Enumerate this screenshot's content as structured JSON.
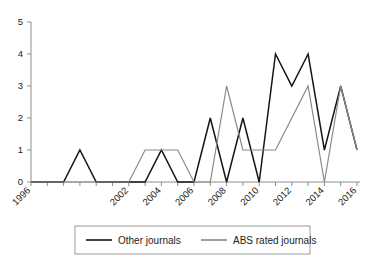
{
  "chart_data": {
    "type": "line",
    "title": "",
    "xlabel": "",
    "ylabel": "",
    "x": [
      1996,
      1997,
      1998,
      1999,
      2000,
      2001,
      2002,
      2003,
      2004,
      2005,
      2006,
      2007,
      2008,
      2009,
      2010,
      2011,
      2012,
      2013,
      2014,
      2015,
      2016
    ],
    "xtick_labels": [
      "1996",
      "2002",
      "2004",
      "2006",
      "2008",
      "2010",
      "2012",
      "2014",
      "2016"
    ],
    "xtick_values": [
      1996,
      2002,
      2004,
      2006,
      2008,
      2010,
      2012,
      2014,
      2016
    ],
    "ytick_labels": [
      "0",
      "1",
      "2",
      "3",
      "4",
      "5"
    ],
    "ytick_values": [
      0,
      1,
      2,
      3,
      4,
      5
    ],
    "xlim": [
      1996,
      2016
    ],
    "ylim": [
      0,
      5
    ],
    "grid": false,
    "legend_position": "bottom",
    "series": [
      {
        "name": "Other journals",
        "color": "#151515",
        "values": [
          0,
          0,
          0,
          1,
          0,
          0,
          0,
          0,
          1,
          0,
          0,
          2,
          0,
          2,
          0,
          4,
          3,
          4,
          1,
          3,
          1
        ]
      },
      {
        "name": "ABS rated journals",
        "color": "#8a8a8a",
        "values": [
          0,
          0,
          0,
          0,
          0,
          0,
          0,
          1,
          1,
          1,
          0,
          0,
          3,
          1,
          1,
          1,
          2,
          3,
          0,
          3,
          1
        ]
      }
    ]
  },
  "legend": {
    "items": [
      {
        "label": "Other journals",
        "color": "#151515"
      },
      {
        "label": "ABS rated journals",
        "color": "#8a8a8a"
      }
    ]
  }
}
